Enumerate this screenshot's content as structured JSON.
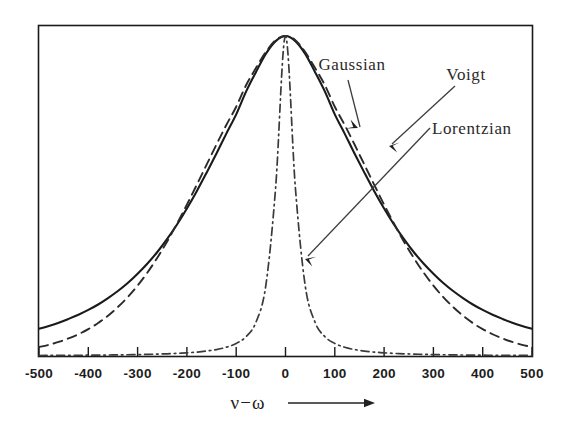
{
  "figure": {
    "background": "#ffffff",
    "frame_color": "#1a1a1a",
    "ink_color": "#2a2a2a"
  },
  "axis_title": {
    "text": "ν−ω",
    "arrow_name": "axis-direction-arrow"
  },
  "annotations": [
    {
      "label": "Gaussian",
      "target": "gaussian-curve"
    },
    {
      "label": "Voigt",
      "target": "voigt-curve"
    },
    {
      "label": "Lorentzian",
      "target": "lorentzian-curve"
    }
  ],
  "chart_data": {
    "type": "line",
    "title": "",
    "xlabel": "ν−ω",
    "ylabel": "",
    "xlim": [
      -500,
      500
    ],
    "ylim": [
      0,
      1
    ],
    "grid": false,
    "legend_position": "inline-annotations",
    "xticks": [
      -500,
      -400,
      -300,
      -200,
      -100,
      0,
      100,
      200,
      300,
      400,
      500
    ],
    "xticklabels": [
      "-500",
      "-400",
      "-300",
      "-200",
      "-100",
      "0",
      "100",
      "200",
      "300",
      "400",
      "500"
    ],
    "yticks": [],
    "yticklabels": [],
    "x": [
      -500,
      -480,
      -460,
      -440,
      -420,
      -400,
      -380,
      -360,
      -340,
      -320,
      -300,
      -280,
      -260,
      -240,
      -220,
      -200,
      -180,
      -160,
      -140,
      -120,
      -100,
      -80,
      -60,
      -40,
      -20,
      0,
      20,
      40,
      60,
      80,
      100,
      120,
      140,
      160,
      180,
      200,
      220,
      240,
      260,
      280,
      300,
      320,
      340,
      360,
      380,
      400,
      420,
      440,
      460,
      480,
      500
    ],
    "series": [
      {
        "name": "Voigt",
        "linestyle": "solid",
        "color": "#1a1a1a",
        "peak_x": 0,
        "peak_y": 1.0,
        "values": [
          0.085,
          0.094,
          0.104,
          0.116,
          0.129,
          0.144,
          0.161,
          0.181,
          0.203,
          0.228,
          0.257,
          0.289,
          0.325,
          0.366,
          0.411,
          0.461,
          0.515,
          0.573,
          0.633,
          0.695,
          0.755,
          0.826,
          0.887,
          0.944,
          0.984,
          1.0,
          0.984,
          0.944,
          0.887,
          0.826,
          0.755,
          0.695,
          0.633,
          0.573,
          0.515,
          0.461,
          0.411,
          0.366,
          0.325,
          0.289,
          0.257,
          0.228,
          0.203,
          0.181,
          0.161,
          0.144,
          0.129,
          0.116,
          0.104,
          0.094,
          0.085
        ]
      },
      {
        "name": "Gaussian",
        "linestyle": "dashed",
        "color": "#2a2a2a",
        "peak_x": 0,
        "peak_y": 1.0,
        "values": [
          0.028,
          0.035,
          0.044,
          0.055,
          0.068,
          0.084,
          0.103,
          0.126,
          0.153,
          0.184,
          0.22,
          0.261,
          0.307,
          0.358,
          0.414,
          0.473,
          0.535,
          0.598,
          0.661,
          0.722,
          0.779,
          0.846,
          0.9,
          0.95,
          0.987,
          1.0,
          0.987,
          0.95,
          0.9,
          0.846,
          0.779,
          0.722,
          0.661,
          0.598,
          0.535,
          0.473,
          0.414,
          0.358,
          0.307,
          0.261,
          0.22,
          0.184,
          0.153,
          0.126,
          0.103,
          0.084,
          0.068,
          0.055,
          0.044,
          0.035,
          0.028
        ]
      },
      {
        "name": "Lorentzian",
        "linestyle": "dashdot",
        "color": "#3a3a3a",
        "peak_x": 0,
        "peak_y": 1.0,
        "values": [
          0.0016,
          0.0017,
          0.0019,
          0.0021,
          0.0023,
          0.0025,
          0.0028,
          0.0031,
          0.0035,
          0.0039,
          0.0044,
          0.0051,
          0.0059,
          0.0069,
          0.0082,
          0.0099,
          0.0122,
          0.0155,
          0.0202,
          0.0274,
          0.0392,
          0.0602,
          0.1053,
          0.2195,
          0.5263,
          1.0,
          0.5263,
          0.2195,
          0.1053,
          0.0602,
          0.0392,
          0.0274,
          0.0202,
          0.0155,
          0.0122,
          0.0099,
          0.0082,
          0.0069,
          0.0059,
          0.0051,
          0.0044,
          0.0039,
          0.0035,
          0.0031,
          0.0028,
          0.0025,
          0.0023,
          0.0021,
          0.0019,
          0.0017,
          0.0016
        ]
      }
    ]
  }
}
